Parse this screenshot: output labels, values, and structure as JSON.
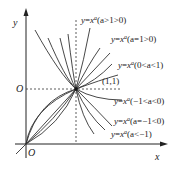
{
  "diagram": {
    "axes": {
      "x_label": "x",
      "y_label": "y",
      "origin_label": "O",
      "y_marker_label": "O"
    },
    "point": {
      "label": "(1,1)"
    },
    "curves": [
      {
        "id": "a_gt_1",
        "label": "y=x",
        "exponent": "a",
        "condition": "(a>1>0)"
      },
      {
        "id": "a_eq_1",
        "label": "y=x",
        "exponent": "a",
        "condition": "(a=1>0)"
      },
      {
        "id": "a_0_1",
        "label": "y=x",
        "exponent": "a",
        "condition": "(0<a<1)"
      },
      {
        "id": "a_m1_0",
        "label": "y=x",
        "exponent": "a",
        "condition": "(−1<a<0)"
      },
      {
        "id": "a_eq_m1",
        "label": "y=x",
        "exponent": "a",
        "condition": "(a=−1<0)"
      },
      {
        "id": "a_lt_m1",
        "label": "y=x",
        "exponent": "a",
        "condition": "(a<−1)"
      }
    ]
  }
}
